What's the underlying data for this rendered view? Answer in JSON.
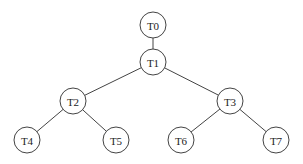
{
  "diagram": {
    "type": "tree",
    "nodes": [
      {
        "id": "T0",
        "label": "T0",
        "x": 153,
        "y": 25
      },
      {
        "id": "T1",
        "label": "T1",
        "x": 153,
        "y": 62
      },
      {
        "id": "T2",
        "label": "T2",
        "x": 73,
        "y": 101
      },
      {
        "id": "T3",
        "label": "T3",
        "x": 230,
        "y": 101
      },
      {
        "id": "T4",
        "label": "T4",
        "x": 27,
        "y": 140
      },
      {
        "id": "T5",
        "label": "T5",
        "x": 116,
        "y": 140
      },
      {
        "id": "T6",
        "label": "T6",
        "x": 181,
        "y": 140
      },
      {
        "id": "T7",
        "label": "T7",
        "x": 276,
        "y": 140
      }
    ],
    "edges": [
      [
        "T0",
        "T1"
      ],
      [
        "T1",
        "T2"
      ],
      [
        "T1",
        "T3"
      ],
      [
        "T2",
        "T4"
      ],
      [
        "T2",
        "T5"
      ],
      [
        "T3",
        "T6"
      ],
      [
        "T3",
        "T7"
      ]
    ],
    "node_radius": 13
  }
}
